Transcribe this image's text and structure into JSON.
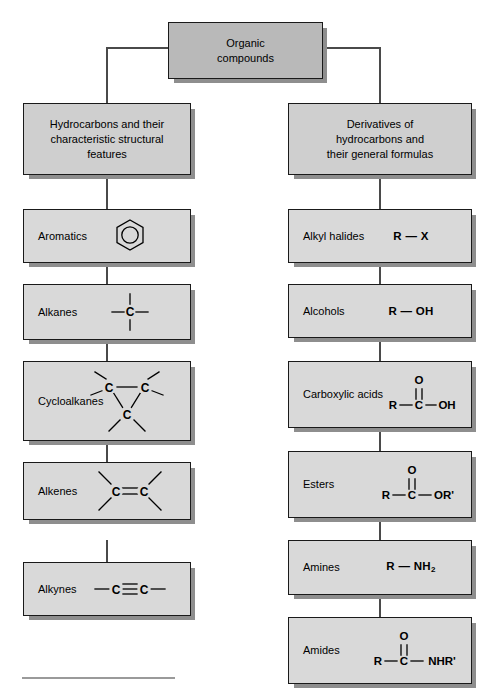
{
  "diagram": {
    "title_node": {
      "line1": "Organic",
      "line2": "compounds"
    },
    "branches": [
      {
        "id": "hydrocarbons",
        "lines": [
          "Hydrocarbons and their",
          "characteristic structural",
          "features"
        ]
      },
      {
        "id": "derivatives",
        "lines": [
          "Derivatives of",
          "hydrocarbons and",
          "their general formulas"
        ]
      }
    ],
    "left_column": [
      {
        "label": "Aromatics",
        "structure": "benzene-ring",
        "formula_text": ""
      },
      {
        "label": "Alkanes",
        "structure": "sp3-carbon",
        "formula_text": ""
      },
      {
        "label": "Cycloalkanes",
        "structure": "cyclopropane",
        "formula_text": ""
      },
      {
        "label": "Alkenes",
        "structure": "double-bond-cc",
        "formula_text": ""
      },
      {
        "label": "Alkynes",
        "structure": "triple-bond-cc",
        "formula_text": ""
      }
    ],
    "right_column": [
      {
        "label": "Alkyl halides",
        "structure": "text",
        "formula_text": "R — X"
      },
      {
        "label": "Alcohols",
        "structure": "text",
        "formula_text": "R — OH"
      },
      {
        "label": "Carboxylic acids",
        "structure": "carbonyl",
        "formula_text": "R—C—OH",
        "carbonyl_left": "R",
        "carbonyl_top": "O",
        "carbonyl_right": "OH"
      },
      {
        "label": "Esters",
        "structure": "carbonyl",
        "formula_text": "R—C—OR'",
        "carbonyl_left": "R",
        "carbonyl_top": "O",
        "carbonyl_right": "OR'"
      },
      {
        "label": "Amines",
        "structure": "text-sub",
        "formula_text": "R — NH",
        "subscript": "2"
      },
      {
        "label": "Amides",
        "structure": "carbonyl",
        "formula_text": "R—C—NHR'",
        "carbonyl_left": "R",
        "carbonyl_top": "O",
        "carbonyl_right": "NHR'"
      }
    ],
    "atom_labels": {
      "carbon": "C",
      "oxygen": "O"
    },
    "colors": {
      "root_fill": "#b9b9b9",
      "branch_fill": "#cfcfcf",
      "leaf_fill": "#d9d9d9",
      "border": "#1a1a1a",
      "shadow": "#8e8e8e",
      "connector": "#4a4a4a",
      "rule": "#9a9a9a"
    }
  }
}
